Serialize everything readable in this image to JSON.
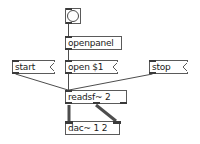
{
  "patch": {
    "title": "pd-patch-readsf",
    "canvas": {
      "width": 200,
      "height": 144,
      "background": "#ffffff"
    },
    "colors": {
      "box_border": "#5a5a5a",
      "text": "#1a1a1a",
      "cord": "#4d4d4d",
      "nub": "#3a3a3a",
      "canvas_bg": "#ffffff"
    },
    "objects": [
      {
        "id": "bang",
        "kind": "bang",
        "label": "",
        "icon": "bang-circle-icon",
        "x": 65,
        "y": 8,
        "w": 16,
        "h": 16,
        "inlets": 1,
        "outlets": 1
      },
      {
        "id": "openpanel",
        "kind": "object",
        "label": "openpanel",
        "x": 65,
        "y": 36,
        "w": 57,
        "h": 14,
        "inlets": 1,
        "outlets": 1
      },
      {
        "id": "open-msg",
        "kind": "message",
        "label": "open $1",
        "x": 65,
        "y": 60,
        "w": 53,
        "h": 14,
        "inlets": 1,
        "outlets": 1
      },
      {
        "id": "start-msg",
        "kind": "message",
        "label": "start",
        "x": 12,
        "y": 60,
        "w": 43,
        "h": 14,
        "inlets": 1,
        "outlets": 1
      },
      {
        "id": "stop-msg",
        "kind": "message",
        "label": "stop",
        "x": 149,
        "y": 60,
        "w": 39,
        "h": 14,
        "inlets": 1,
        "outlets": 1
      },
      {
        "id": "readsf",
        "kind": "object",
        "label": "readsf~ 2",
        "x": 65,
        "y": 90,
        "w": 62,
        "h": 14,
        "inlets": 1,
        "outlets": 3
      },
      {
        "id": "dac",
        "kind": "object",
        "label": "dac~ 1 2",
        "x": 65,
        "y": 121,
        "w": 55,
        "h": 14,
        "inlets": 2,
        "outlets": 0
      }
    ],
    "connections": [
      {
        "from": "bang",
        "outlet": 0,
        "to": "openpanel",
        "inlet": 0,
        "type": "message"
      },
      {
        "from": "openpanel",
        "outlet": 0,
        "to": "open-msg",
        "inlet": 0,
        "type": "message"
      },
      {
        "from": "open-msg",
        "outlet": 0,
        "to": "readsf",
        "inlet": 0,
        "type": "message"
      },
      {
        "from": "start-msg",
        "outlet": 0,
        "to": "readsf",
        "inlet": 0,
        "type": "message"
      },
      {
        "from": "stop-msg",
        "outlet": 0,
        "to": "readsf",
        "inlet": 0,
        "type": "message"
      },
      {
        "from": "readsf",
        "outlet": 0,
        "to": "dac",
        "inlet": 0,
        "type": "signal"
      },
      {
        "from": "readsf",
        "outlet": 1,
        "to": "dac",
        "inlet": 1,
        "type": "signal"
      }
    ]
  }
}
